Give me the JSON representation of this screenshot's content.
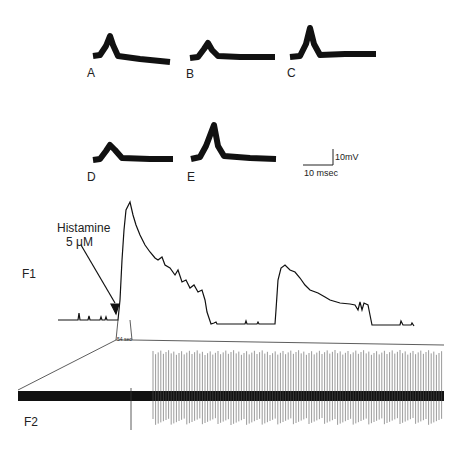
{
  "panels": {
    "waveforms": [
      {
        "label": "A",
        "x": 93,
        "peak": 0.55
      },
      {
        "label": "B",
        "x": 190,
        "peak": 0.4
      },
      {
        "label": "C",
        "x": 290,
        "peak": 0.75
      },
      {
        "label": "D",
        "x": 93,
        "peak": 0.4
      },
      {
        "label": "E",
        "x": 190,
        "peak": 0.8
      }
    ],
    "scale_bar": {
      "voltage": "10mV",
      "time": "10 msec"
    },
    "f1": {
      "label": "F1",
      "annotation_line1": "Histamine",
      "annotation_line2": "5 μM",
      "zoom_window": "54 sec"
    },
    "f2": {
      "label": "F2"
    }
  },
  "colors": {
    "trace": "#111111",
    "background": "#ffffff",
    "spikes": "#555555"
  }
}
